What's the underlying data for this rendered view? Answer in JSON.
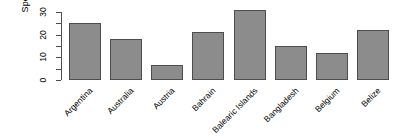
{
  "chart_data": {
    "type": "bar",
    "title": "",
    "xlabel": "",
    "ylabel": "Spending",
    "categories": [
      "Argentina",
      "Australia",
      "Austria",
      "Bahrain",
      "Balearic Islands",
      "Bangladesh",
      "Belgium",
      "Belize"
    ],
    "values": [
      25,
      18,
      6.5,
      21,
      31,
      15,
      12,
      22
    ],
    "ylim": [
      0,
      30
    ],
    "yticks": [
      0,
      10,
      20,
      30
    ],
    "ytick_labels": [
      "0",
      "10",
      "20",
      "30"
    ],
    "yminor_ticks": [
      5,
      15,
      25
    ],
    "grid": false,
    "legend": null,
    "bar_color": "#8c8c8c",
    "bar_border_color": "#4d4d4d",
    "axis_color": "#4d4d4d",
    "background": "#ffffff",
    "xtick_label_rotation": -45
  }
}
